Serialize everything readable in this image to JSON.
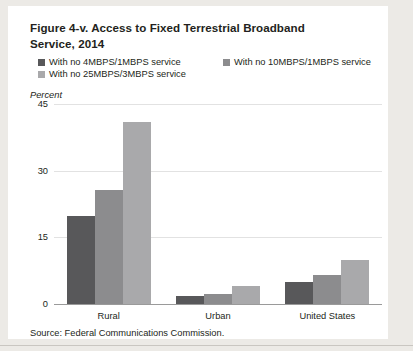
{
  "figure": {
    "title": "Figure 4-v. Access to Fixed Terrestrial Broadband Service, 2014",
    "title_line1": "Figure 4-v. Access to Fixed Terrestrial Broadband",
    "title_line2": "Service, 2014",
    "axis_unit_label": "Percent",
    "source": "Source: Federal Communications Commission."
  },
  "colors": {
    "series_dark": "#58585a",
    "series_medium": "#8c8c8e",
    "series_light": "#a9a9ab",
    "gridline": "#e2e2e2",
    "axis": "#9a9a9a",
    "text": "#231f20",
    "panel_background": "#ffffff",
    "page_background": "#eceae6"
  },
  "chart_data": {
    "type": "bar",
    "title": "Figure 4-v. Access to Fixed Terrestrial Broadband Service, 2014",
    "xlabel": "",
    "ylabel": "Percent",
    "ylim": [
      0,
      45
    ],
    "yticks": [
      0,
      15,
      30,
      45
    ],
    "grid": true,
    "legend_position": "top",
    "categories": [
      "Rural",
      "Urban",
      "United States"
    ],
    "series": [
      {
        "name": "With no 4MBPS/1MBPS service",
        "color": "#58585a",
        "values": [
          19.7,
          1.9,
          5.0
        ]
      },
      {
        "name": "With no 10MBPS/1MBPS service",
        "color": "#8c8c8e",
        "values": [
          25.6,
          2.2,
          6.5
        ]
      },
      {
        "name": "With no 25MBPS/3MBPS service",
        "color": "#a9a9ab",
        "values": [
          41.0,
          4.1,
          10.0
        ]
      }
    ]
  }
}
